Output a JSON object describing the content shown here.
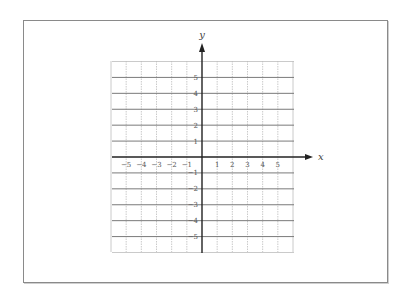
{
  "diagram": {
    "type": "coordinate-plane",
    "axes": {
      "x_label": "x",
      "y_label": "y",
      "x_range": [
        -6,
        6
      ],
      "y_range": [
        -6,
        6
      ]
    },
    "x_ticks": [
      "-5",
      "-4",
      "-3",
      "-2",
      "-1",
      "1",
      "2",
      "3",
      "4",
      "5"
    ],
    "y_ticks_positive": [
      "5",
      "4",
      "3",
      "2",
      "1"
    ],
    "y_ticks_negative": [
      "-1",
      "-2",
      "-3",
      "-4",
      "-5"
    ],
    "grid": {
      "columns": 12,
      "rows": 12,
      "major_lines": "every 1 unit (horizontal bold)",
      "minor_lines": "dotted vertical"
    },
    "colors": {
      "grid": "#bdbdbd",
      "grid_major": "#7a7a7a",
      "axis": "#222222",
      "frame": "#8a8a8a"
    }
  }
}
